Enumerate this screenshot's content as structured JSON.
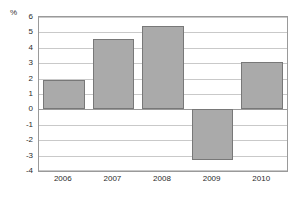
{
  "chart_data": {
    "type": "bar",
    "title": "",
    "subtitle": "",
    "xlabel": "",
    "ylabel": "%",
    "unit_label": "%",
    "categories": [
      "2006",
      "2007",
      "2008",
      "2009",
      "2010"
    ],
    "values": [
      1.9,
      4.6,
      5.4,
      -3.3,
      3.1
    ],
    "series": [
      {
        "name": "",
        "values": [
          1.9,
          4.6,
          5.4,
          -3.3,
          3.1
        ]
      }
    ],
    "ylim": [
      -4,
      6
    ],
    "ytick_step": 1,
    "ytick_labels": [
      "6",
      "5",
      "4",
      "3",
      "2",
      "1",
      "0",
      "-1",
      "-2",
      "-3",
      "-4"
    ],
    "ytick_values": [
      6,
      5,
      4,
      3,
      2,
      1,
      0,
      -1,
      -2,
      -3,
      -4
    ],
    "grid": true,
    "grid_axis": "y",
    "legend": false,
    "legend_position": "none",
    "bar_fill_color": "#aaaaaa",
    "bar_border_color": "#787878",
    "gridline_color": "#c9c9c9",
    "axis_color": "#9a9a9a",
    "plot_background": "#ffffff",
    "text_color": "#2b2b2b"
  }
}
